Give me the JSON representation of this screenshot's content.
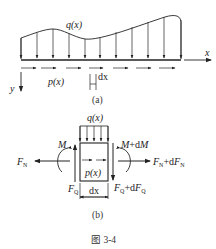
{
  "figure": {
    "caption": "图 3-4",
    "panel_a": {
      "label": "(a)",
      "load_label": "q(x)",
      "axial_load_label": "p(x)",
      "element_label": "dx",
      "x_axis_label": "x",
      "y_axis_label": "y"
    },
    "panel_b": {
      "label": "(b)",
      "load_label": "q(x)",
      "axial_load_label": "p(x)",
      "width_label": "dx",
      "left_moment": "M",
      "right_moment": "M+dM",
      "left_normal": "F_N",
      "right_normal": "F_N+dF_N",
      "left_shear": "F_Q",
      "right_shear": "F_Q+dF_Q"
    }
  },
  "colors": {
    "line": "#222222",
    "background": "#ffffff"
  }
}
